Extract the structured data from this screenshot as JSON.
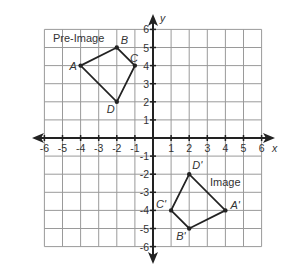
{
  "figure": {
    "type": "coordinate-plane-transformation",
    "axes": {
      "x_label": "x",
      "y_label": "y",
      "x_range": [
        -6,
        6
      ],
      "y_range": [
        -6,
        6
      ],
      "x_ticks": [
        "-6",
        "-5",
        "-4",
        "-3",
        "-2",
        "-1",
        "1",
        "2",
        "3",
        "4",
        "5",
        "6"
      ],
      "y_ticks": [
        "6",
        "5",
        "4",
        "3",
        "2",
        "1",
        "-1",
        "-2",
        "-3",
        "-4",
        "-5",
        "-6"
      ],
      "grid": true
    },
    "pre_image": {
      "label": "Pre-Image",
      "vertices": [
        {
          "name": "A",
          "x": -4,
          "y": 4
        },
        {
          "name": "B",
          "x": -2,
          "y": 5
        },
        {
          "name": "C",
          "x": -1,
          "y": 4
        },
        {
          "name": "D",
          "x": -2,
          "y": 2
        }
      ]
    },
    "image": {
      "label": "Image",
      "vertices": [
        {
          "name": "A'",
          "x": 4,
          "y": -4
        },
        {
          "name": "B'",
          "x": 2,
          "y": -5
        },
        {
          "name": "C'",
          "x": 1,
          "y": -4
        },
        {
          "name": "D'",
          "x": 2,
          "y": -2
        }
      ]
    },
    "colors": {
      "grid": "#9a9a9a",
      "axis": "#222222",
      "shape": "#222222",
      "text": "#333333"
    }
  }
}
